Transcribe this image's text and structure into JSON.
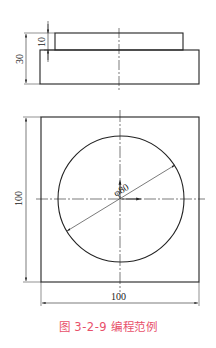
{
  "figure": {
    "caption": "图 3-2-9   编程范例",
    "caption_color": "#e8506a",
    "line_color": "#222222"
  },
  "side_view": {
    "dimensions": {
      "total_height": "30",
      "step_height": "10"
    }
  },
  "top_view": {
    "dimensions": {
      "width": "100",
      "height": "100",
      "circle_diameter": "φ80"
    }
  }
}
